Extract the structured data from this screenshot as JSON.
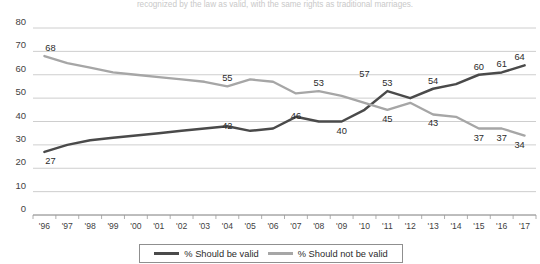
{
  "cut_title": "recognized by the law as valid, with the same rights as traditional marriages.",
  "legend": {
    "valid_label": "% Should be valid",
    "not_valid_label": "% Should not be valid"
  },
  "colors": {
    "valid": "#4a4a4a",
    "not_valid": "#a6a6a6",
    "grid": "#c2c2c2",
    "axis": "#8a8a8a",
    "background": "#ffffff"
  },
  "chart_data": {
    "type": "line",
    "title": "",
    "xlabel": "",
    "ylabel": "",
    "ylim": [
      0,
      80
    ],
    "yticks": [
      0,
      10,
      20,
      30,
      40,
      50,
      60,
      70,
      80
    ],
    "grid": true,
    "legend_position": "bottom",
    "categories": [
      "'96",
      "'97",
      "'98",
      "'99",
      "'00",
      "'01",
      "'02",
      "'03",
      "'04",
      "'05",
      "'06",
      "'07",
      "'08",
      "'09",
      "'10",
      "'11",
      "'12",
      "'13",
      "'14",
      "'15",
      "'16",
      "'17"
    ],
    "series": [
      {
        "name": "% Should be valid",
        "color": "#4a4a4a",
        "values": [
          27,
          30,
          32,
          33,
          34,
          35,
          36,
          37,
          38,
          36,
          37,
          42,
          40,
          40,
          45,
          53,
          50,
          54,
          56,
          60,
          61,
          64
        ],
        "labels": [
          {
            "index": 0,
            "value": 27,
            "text": "27",
            "pos": "below"
          },
          {
            "index": 8,
            "value": 42,
            "text": "42",
            "pos": "below"
          },
          {
            "index": 11,
            "value": 46,
            "text": "46",
            "pos": "below"
          },
          {
            "index": 13,
            "value": 40,
            "text": "40",
            "pos": "below"
          },
          {
            "index": 15,
            "value": 53,
            "text": "53",
            "pos": "above"
          },
          {
            "index": 17,
            "value": 54,
            "text": "54",
            "pos": "above"
          },
          {
            "index": 19,
            "value": 60,
            "text": "60",
            "pos": "above"
          },
          {
            "index": 20,
            "value": 61,
            "text": "61",
            "pos": "above"
          },
          {
            "index": 21,
            "value": 64,
            "text": "64",
            "pos": "above"
          }
        ]
      },
      {
        "name": "% Should not be valid",
        "color": "#a6a6a6",
        "values": [
          68,
          65,
          63,
          61,
          60,
          59,
          58,
          57,
          55,
          58,
          57,
          52,
          53,
          51,
          48,
          45,
          48,
          43,
          42,
          37,
          37,
          34
        ],
        "labels": [
          {
            "index": 0,
            "value": 68,
            "text": "68",
            "pos": "above"
          },
          {
            "index": 8,
            "value": 55,
            "text": "55",
            "pos": "above"
          },
          {
            "index": 12,
            "value": 53,
            "text": "53",
            "pos": "above"
          },
          {
            "index": 14,
            "value": 57,
            "text": "57",
            "pos": "above"
          },
          {
            "index": 15,
            "value": 45,
            "text": "45",
            "pos": "below"
          },
          {
            "index": 17,
            "value": 43,
            "text": "43",
            "pos": "below"
          },
          {
            "index": 19,
            "value": 37,
            "text": "37",
            "pos": "below"
          },
          {
            "index": 20,
            "value": 37,
            "text": "37",
            "pos": "below"
          },
          {
            "index": 21,
            "value": 34,
            "text": "34",
            "pos": "below"
          }
        ]
      }
    ]
  }
}
